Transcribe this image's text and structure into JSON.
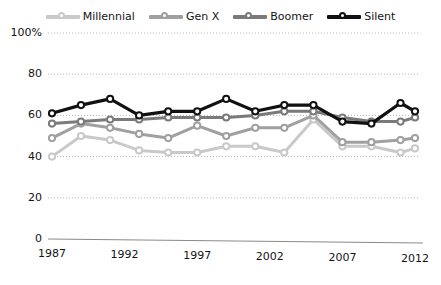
{
  "chart_data": {
    "type": "line",
    "title": "",
    "xlabel": "",
    "ylabel": "",
    "xlim": [
      1987,
      2012
    ],
    "ylim": [
      0,
      100
    ],
    "grid": true,
    "legend_position": "top-center",
    "x": [
      1987,
      1989,
      1991,
      1993,
      1995,
      1997,
      1999,
      2001,
      2003,
      2005,
      2007,
      2009,
      2011,
      2012
    ],
    "ytick_labels": [
      "0",
      "20",
      "40",
      "60",
      "80",
      "100%"
    ],
    "ytick_values": [
      0,
      20,
      40,
      60,
      80,
      100
    ],
    "xtick_labels": [
      "1987",
      "1992",
      "1997",
      "2002",
      "2007",
      "2012"
    ],
    "xtick_values": [
      1987,
      1992,
      1997,
      2002,
      2007,
      2012
    ],
    "series": [
      {
        "name": "Millennial",
        "color": "#c9c9c9",
        "values": [
          40,
          50,
          48,
          43,
          42,
          42,
          45,
          45,
          42,
          58,
          45,
          45,
          42,
          44
        ]
      },
      {
        "name": "Gen X",
        "color": "#a0a0a0",
        "values": [
          49,
          56,
          54,
          51,
          49,
          55,
          50,
          54,
          54,
          60,
          47,
          47,
          48,
          49
        ]
      },
      {
        "name": "Boomer",
        "color": "#7a7a7a",
        "values": [
          56,
          57,
          58,
          58,
          59,
          59,
          59,
          60,
          62,
          62,
          59,
          57,
          57,
          59
        ]
      },
      {
        "name": "Silent",
        "color": "#111111",
        "values": [
          61,
          65,
          68,
          60,
          62,
          62,
          68,
          62,
          65,
          65,
          57,
          56,
          66,
          62
        ]
      }
    ]
  }
}
